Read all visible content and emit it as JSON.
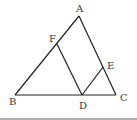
{
  "diagram": {
    "type": "geometry-triangle",
    "points": {
      "A": {
        "label": "A",
        "x": 79,
        "y": 16,
        "lx": 76,
        "ly": 12
      },
      "B": {
        "label": "B",
        "x": 15,
        "y": 95,
        "lx": 9,
        "ly": 105
      },
      "C": {
        "label": "C",
        "x": 116,
        "y": 95,
        "lx": 120,
        "ly": 101
      },
      "D": {
        "label": "D",
        "x": 82,
        "y": 95,
        "lx": 79,
        "ly": 109
      },
      "E": {
        "label": "E",
        "x": 103,
        "y": 67,
        "lx": 107,
        "ly": 69
      },
      "F": {
        "label": "F",
        "x": 57,
        "y": 44,
        "lx": 49,
        "ly": 42
      }
    },
    "segments": [
      [
        "A",
        "B"
      ],
      [
        "A",
        "C"
      ],
      [
        "B",
        "C"
      ],
      [
        "F",
        "D"
      ],
      [
        "D",
        "E"
      ]
    ],
    "line_color": "#222222",
    "footer_rule_color": "#b0b0b0"
  }
}
